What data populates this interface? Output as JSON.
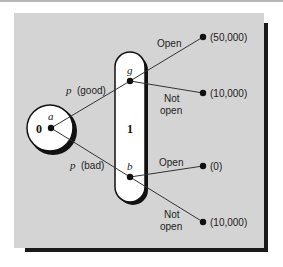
{
  "diagram": {
    "type": "decision-tree",
    "colors": {
      "panel": "#d4d4d4",
      "shadow": "#1a1a1a",
      "node_fill": "#ffffff",
      "line": "#333333",
      "dot": "#111111"
    },
    "stage0": {
      "number": "0",
      "node_label": "a"
    },
    "stage1": {
      "number": "1",
      "nodes": {
        "g": {
          "label": "g"
        },
        "b": {
          "label": "b"
        }
      }
    },
    "branches": {
      "good": {
        "prefix": "p",
        "text": "(good)"
      },
      "bad": {
        "prefix": "p",
        "text": "(bad)"
      }
    },
    "outcomes": [
      {
        "from": "g",
        "action": "Open",
        "action_line2": "",
        "payoff": "(50,000)"
      },
      {
        "from": "g",
        "action": "Not",
        "action_line2": "open",
        "payoff": "(10,000)"
      },
      {
        "from": "b",
        "action": "Open",
        "action_line2": "",
        "payoff": "(0)"
      },
      {
        "from": "b",
        "action": "Not",
        "action_line2": "open",
        "payoff": "(10,000)"
      }
    ]
  }
}
